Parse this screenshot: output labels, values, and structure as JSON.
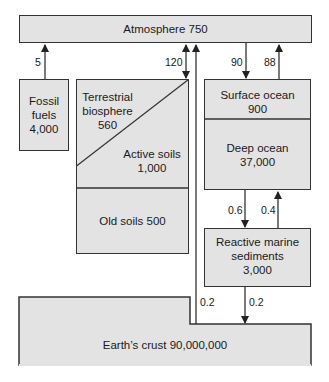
{
  "diagram": {
    "type": "carbon-cycle-reservoirs",
    "reservoirs": {
      "atmosphere": {
        "label": "Atmosphere 750",
        "name": "Atmosphere",
        "value": 750
      },
      "fossil_fuels": {
        "label": "Fossil\nfuels\n4,000",
        "name": "Fossil fuels",
        "value": 4000
      },
      "terrestrial_biosphere": {
        "label": "Terrestrial\nbiosphere\n560",
        "name": "Terrestrial biosphere",
        "value": 560
      },
      "active_soils": {
        "label": "Active soils\n1,000",
        "name": "Active soils",
        "value": 1000
      },
      "old_soils": {
        "label": "Old soils 500",
        "name": "Old soils",
        "value": 500
      },
      "surface_ocean": {
        "label": "Surface ocean\n900",
        "name": "Surface ocean",
        "value": 900
      },
      "deep_ocean": {
        "label": "Deep ocean\n37,000",
        "name": "Deep ocean",
        "value": 37000
      },
      "reactive_marine_sediments": {
        "label": "Reactive marine\nsediments\n3,000",
        "name": "Reactive marine sediments",
        "value": 3000
      },
      "earths_crust": {
        "label": "Earth’s crust 90,000,000",
        "name": "Earth’s crust",
        "value": 90000000
      }
    },
    "fluxes": [
      {
        "from": "Fossil fuels",
        "to": "Atmosphere",
        "label": "5"
      },
      {
        "from": "Terrestrial biosphere",
        "to": "Atmosphere",
        "label": "120",
        "bidirectional": true
      },
      {
        "from": "Atmosphere",
        "to": "Surface ocean",
        "label": "90"
      },
      {
        "from": "Surface ocean",
        "to": "Atmosphere",
        "label": "88"
      },
      {
        "from": "Deep ocean",
        "to": "Reactive marine sediments",
        "label": "0.6"
      },
      {
        "from": "Reactive marine sediments",
        "to": "Deep ocean",
        "label": "0.4"
      },
      {
        "from": "Earth’s crust",
        "to": "Atmosphere",
        "label": "0.2"
      },
      {
        "from": "Reactive marine sediments",
        "to": "Earth’s crust",
        "label": "0.2"
      }
    ],
    "flux_labels": {
      "fossil": "5",
      "terrestrial": "120",
      "ocean_down": "90",
      "ocean_up": "88",
      "deep_down": "0.6",
      "deep_up": "0.4",
      "crust_up": "0.2",
      "sediment_down": "0.2"
    }
  }
}
